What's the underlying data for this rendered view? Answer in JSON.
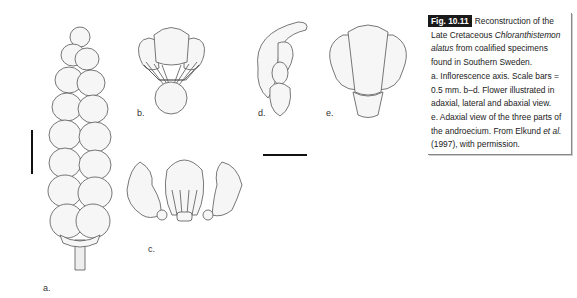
{
  "figure": {
    "panels": [
      {
        "id": "a",
        "label": "a.",
        "description": "Inflorescence axis"
      },
      {
        "id": "b",
        "label": "b.",
        "description": "Flower, adaxial view"
      },
      {
        "id": "c",
        "label": "c.",
        "description": "Three parts of the androecium, adaxial view"
      },
      {
        "id": "d",
        "label": "d.",
        "description": "Flower, lateral view"
      },
      {
        "id": "e",
        "label": "e.",
        "description": "Flower, abaxial view"
      }
    ],
    "scale_bars": [
      "vertical (panel a)",
      "horizontal (panels b–e)"
    ]
  },
  "caption": {
    "fig_label": "Fig. 10.11",
    "line1": "Reconstruction of the",
    "line2_pre": "Late Cretaceous ",
    "line2_italic": "Chloranthistemon",
    "line3_italic": "alatus",
    "line3_post": " from coalified specimens",
    "line4": "found in Southern Sweden.",
    "line5": "a. Inflorescence axis. Scale bars =",
    "line6": "0.5 mm. b–d. Flower illustrated in",
    "line7": "adaxial, lateral and abaxial view.",
    "line8": "e. Adaxial view of the three parts of",
    "line9_pre": "the androecium. From Elkund ",
    "line9_italic": "et al.",
    "line10": "(1997), with permission."
  }
}
